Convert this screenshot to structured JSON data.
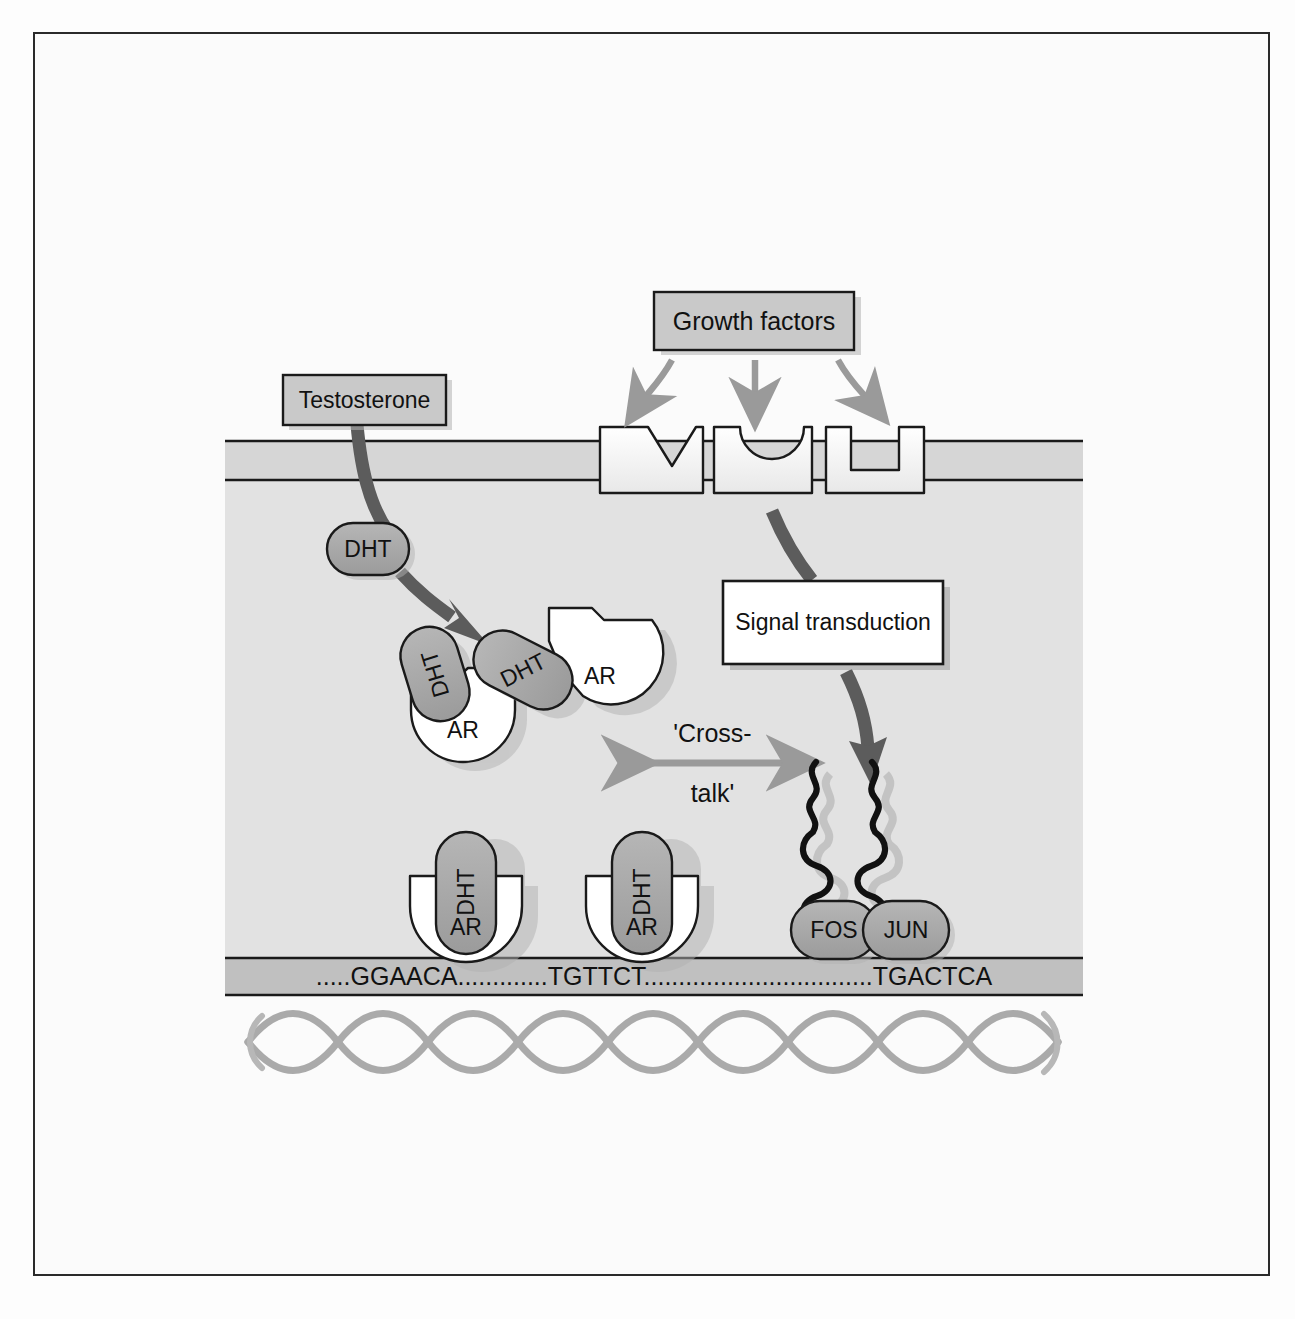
{
  "figure": {
    "background_color": "#fbfbfb",
    "border_color": "#2a2a2a"
  },
  "palette": {
    "box_gray_fill": "#c9c9c9",
    "box_white_fill": "#ffffff",
    "membrane_fill": "#d2d2d2",
    "cytoplasm_fill": "#e0e0e0",
    "dna_band_fill": "#bdbdbd",
    "protein_gray": "#a8a8a8",
    "protein_white": "#ffffff",
    "arrow_gray": "#9a9a9a",
    "arrow_dark": "#5a5a5a",
    "outline": "#1a1a1a",
    "shadow": "#b0b0b0",
    "helix_gray": "#a9a9a9"
  },
  "nodes": {
    "growth_factors": {
      "label": "Growth factors",
      "shape": "rect",
      "fill": "gray"
    },
    "testosterone": {
      "label": "Testosterone",
      "shape": "rect",
      "fill": "gray"
    },
    "signal_transduction": {
      "label": "Signal transduction",
      "shape": "rect",
      "fill": "white"
    }
  },
  "ligands": {
    "dht_free": {
      "label": "DHT"
    },
    "dht_bound_left": {
      "label": "DHT"
    },
    "dht_bound_right": {
      "label": "DHT"
    },
    "dht_dna_left": {
      "label": "DHT"
    },
    "dht_dna_right": {
      "label": "DHT"
    }
  },
  "receptors": {
    "ar_cyto_left": {
      "label": "AR"
    },
    "ar_cyto_right": {
      "label": "AR"
    },
    "ar_dna_left": {
      "label": "AR"
    },
    "ar_dna_right": {
      "label": "AR"
    }
  },
  "transcription_factors": {
    "fos": {
      "label": "FOS"
    },
    "jun": {
      "label": "JUN"
    }
  },
  "membrane_receptors": [
    {
      "name": "v-notch-receptor",
      "notch": "v"
    },
    {
      "name": "u-notch-receptor",
      "notch": "u"
    },
    {
      "name": "square-notch-receptor",
      "notch": "square"
    }
  ],
  "annotations": {
    "crosstalk_line1": "'Cross-",
    "crosstalk_line2": "talk'"
  },
  "dna": {
    "sequence_text": ".....GGAACA.............TGTTCT.................................TGACTCA",
    "are_half_site_1": "GGAACA",
    "are_half_site_2": "TGTTCT",
    "ap1_site": "TGACTCA"
  },
  "arrows": {
    "gf_to_receptor_left": "curved-gray-arrow",
    "gf_to_receptor_mid": "straight-gray-arrow",
    "gf_to_receptor_right": "curved-gray-arrow",
    "testosterone_to_dht": "thick-curved-dark-arrow",
    "receptor_to_ap1": "thick-curved-dark-arrow",
    "crosstalk": "double-headed-gray-arrow"
  }
}
